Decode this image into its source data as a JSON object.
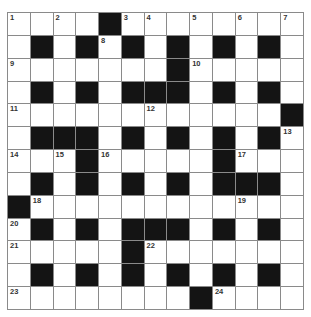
{
  "puzzle": {
    "rows": 13,
    "cols": 13,
    "grid": [
      "....#........",
      ".#.#.#.#.#.#.",
      ".......#.....",
      ".#.#.###.#.#.",
      "............#",
      ".###.#.#.#.#.",
      "...#.....#...",
      ".#.#.#.#.###.",
      "#............",
      ".#.#.###.#.#.",
      ".....#.......",
      ".#.#.#.#.#.#.",
      "........#...."
    ],
    "numbers": [
      {
        "row": 0,
        "col": 0,
        "n": "1"
      },
      {
        "row": 0,
        "col": 2,
        "n": "2"
      },
      {
        "row": 0,
        "col": 5,
        "n": "3"
      },
      {
        "row": 0,
        "col": 6,
        "n": "4"
      },
      {
        "row": 0,
        "col": 8,
        "n": "5"
      },
      {
        "row": 0,
        "col": 10,
        "n": "6"
      },
      {
        "row": 0,
        "col": 12,
        "n": "7"
      },
      {
        "row": 1,
        "col": 4,
        "n": "8"
      },
      {
        "row": 2,
        "col": 0,
        "n": "9"
      },
      {
        "row": 2,
        "col": 8,
        "n": "10"
      },
      {
        "row": 4,
        "col": 0,
        "n": "11"
      },
      {
        "row": 4,
        "col": 6,
        "n": "12"
      },
      {
        "row": 5,
        "col": 12,
        "n": "13"
      },
      {
        "row": 6,
        "col": 0,
        "n": "14"
      },
      {
        "row": 6,
        "col": 2,
        "n": "15"
      },
      {
        "row": 6,
        "col": 4,
        "n": "16"
      },
      {
        "row": 6,
        "col": 10,
        "n": "17"
      },
      {
        "row": 8,
        "col": 1,
        "n": "18"
      },
      {
        "row": 8,
        "col": 10,
        "n": "19"
      },
      {
        "row": 9,
        "col": 0,
        "n": "20"
      },
      {
        "row": 10,
        "col": 0,
        "n": "21"
      },
      {
        "row": 10,
        "col": 6,
        "n": "22"
      },
      {
        "row": 12,
        "col": 0,
        "n": "23"
      },
      {
        "row": 12,
        "col": 9,
        "n": "24"
      }
    ],
    "colors": {
      "block": "#141414",
      "cell": "#ffffff",
      "gridline": "#8a8a8a",
      "number": "#333333"
    }
  }
}
